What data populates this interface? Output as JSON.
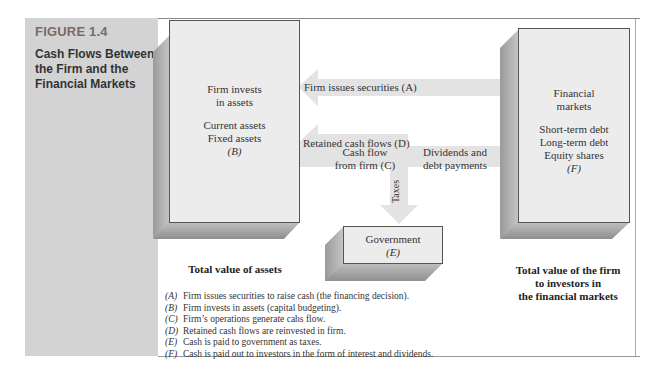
{
  "figure": {
    "number": "FIGURE 1.4",
    "title": "Cash Flows Between the Firm and the Financial Markets"
  },
  "firm_box": {
    "line1": "Firm invests",
    "line2": "in assets",
    "line3": "Current assets",
    "line4": "Fixed assets",
    "tag": "(B)",
    "caption": "Total value of assets"
  },
  "markets_box": {
    "line1": "Financial",
    "line2": "markets",
    "line3": "Short-term debt",
    "line4": "Long-term debt",
    "line5": "Equity shares",
    "tag": "(F)",
    "caption_line1": "Total value of the firm",
    "caption_line2": "to investors in",
    "caption_line3": "the financial markets"
  },
  "government_box": {
    "line1": "Government",
    "tag": "(E)"
  },
  "arrows": {
    "issues": "Firm issues securities (A)",
    "retained": "Retained cash flows (D)",
    "cashflow_line1": "Cash flow",
    "cashflow_line2": "from firm (C)",
    "dividends_line1": "Dividends and",
    "dividends_line2": "debt payments",
    "taxes": "Taxes"
  },
  "legend": [
    {
      "key": "(A)",
      "text": "Firm issues securities to raise cash (the financing decision)."
    },
    {
      "key": "(B)",
      "text": "Firm invests in assets (capital budgeting)."
    },
    {
      "key": "(C)",
      "text": "Firm’s operations generate cahs flow."
    },
    {
      "key": "(D)",
      "text": "Retained cash flows are reinvested in firm."
    },
    {
      "key": "(E)",
      "text": "Cash is paid to government as taxes."
    },
    {
      "key": "(F)",
      "text": "Cash is paid out to investors in the form of interest and dividends."
    }
  ],
  "colors": {
    "sidebar": "#d3d3d3",
    "arrow": "#e3e3e3",
    "box_face": "#ececec",
    "figure_number": "#7a6a66"
  }
}
